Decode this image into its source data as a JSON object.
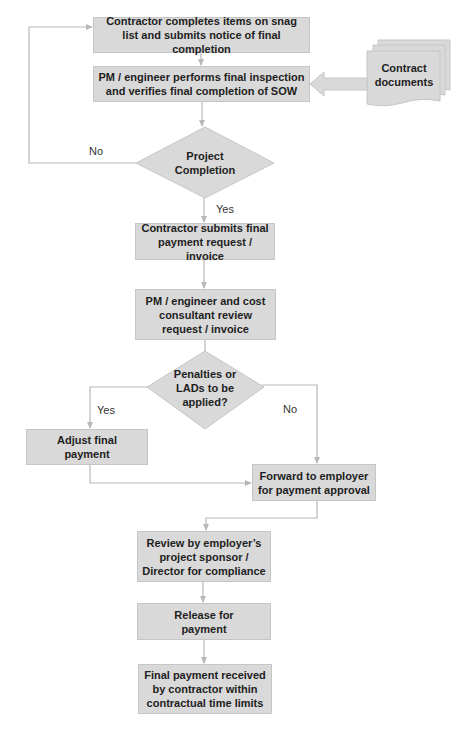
{
  "diagram": {
    "type": "flowchart",
    "colors": {
      "box_fill": "#d9d9d9",
      "line": "#b8b8b8",
      "text": "#1e1e1e"
    },
    "nodes": {
      "snag_list": "Contractor completes items on snag list and submits notice of final completion",
      "final_inspection": "PM / engineer performs final inspection and verifies final completion of SOW",
      "contract_docs": "Contract documents",
      "project_completion": "Project Completion",
      "submit_invoice": "Contractor submits final payment request / invoice",
      "review_invoice": "PM / engineer and cost consultant review request / invoice",
      "penalties_decision": "Penalties or LADs to be applied?",
      "adjust_payment": "Adjust final payment",
      "forward_employer": "Forward to employer for payment approval",
      "sponsor_review": "Review by employer’s project  sponsor / Director for compliance",
      "release_payment": "Release for payment",
      "payment_received": "Final payment received by contractor within contractual time limits"
    },
    "edge_labels": {
      "completion_no": "No",
      "completion_yes": "Yes",
      "penalties_yes": "Yes",
      "penalties_no": "No"
    }
  }
}
